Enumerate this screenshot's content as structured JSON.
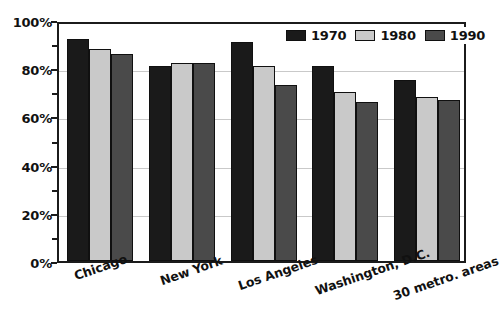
{
  "chart_data": {
    "type": "bar",
    "title": "",
    "subtitle": "",
    "xlabel": "",
    "ylabel": "",
    "ylim": [
      0,
      100
    ],
    "y_unit": "%",
    "grid": true,
    "legend_position": "top-right",
    "categories": [
      "Chicago",
      "New York",
      "Los Angeles",
      "Washington, D.C.",
      "30 metro. areas"
    ],
    "y_ticks": [
      {
        "value": 0,
        "label": "0%"
      },
      {
        "value": 20,
        "label": "20%"
      },
      {
        "value": 40,
        "label": "40%"
      },
      {
        "value": 60,
        "label": "60%"
      },
      {
        "value": 80,
        "label": "80%"
      },
      {
        "value": 100,
        "label": "100%"
      }
    ],
    "y_minor_ticks": [
      10,
      30,
      50,
      70,
      90
    ],
    "series": [
      {
        "name": "1970",
        "color": "#1a1a1a",
        "values": [
          92,
          81,
          91,
          81,
          75
        ]
      },
      {
        "name": "1980",
        "color": "#c9c9c9",
        "values": [
          88,
          82,
          81,
          70,
          68
        ]
      },
      {
        "name": "1990",
        "color": "#4a4a4a",
        "values": [
          86,
          82,
          73,
          66,
          67
        ]
      }
    ]
  },
  "legend": {
    "entries": [
      {
        "label": "1970",
        "swatch_name": "legend-swatch-1970"
      },
      {
        "label": "1980",
        "swatch_name": "legend-swatch-1980"
      },
      {
        "label": "1990",
        "swatch_name": "legend-swatch-1990"
      }
    ]
  },
  "colors": {
    "series_1970": "#1a1a1a",
    "series_1980": "#c9c9c9",
    "series_1990": "#4a4a4a",
    "axis": "#1b1b1b",
    "gridline": "#c9c9c9",
    "background": "#ffffff",
    "text": "#111111"
  }
}
